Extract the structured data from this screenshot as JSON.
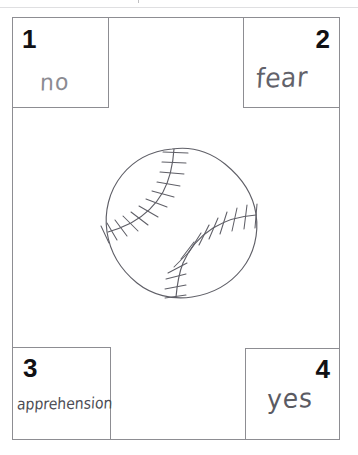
{
  "page": {
    "type": "handwritten-worksheet-scan",
    "background_color": "#ffffff",
    "ink_color": "#5d5d64",
    "line_color": "#8d8d92",
    "width": 358,
    "height": 455
  },
  "artifact": {
    "name": "scan-edge-smudge",
    "visible": true
  },
  "quadrants": [
    {
      "number": "1",
      "answer": "no",
      "position": "top-left",
      "number_corner": "top-left"
    },
    {
      "number": "2",
      "answer": "fear",
      "position": "top-right",
      "number_corner": "top-right"
    },
    {
      "number": "3",
      "answer": "apprehension",
      "position": "bottom-left",
      "number_corner": "top-left"
    },
    {
      "number": "4",
      "answer": "yes",
      "position": "bottom-right",
      "number_corner": "top-right"
    }
  ],
  "drawing": {
    "name": "baseball",
    "description": "hand-drawn baseball with two curved seams and stitch marks",
    "stroke_color": "#5f5f67",
    "seam_count": 2,
    "stitch_count_top_seam": 13,
    "stitch_count_bottom_seam": 12
  }
}
